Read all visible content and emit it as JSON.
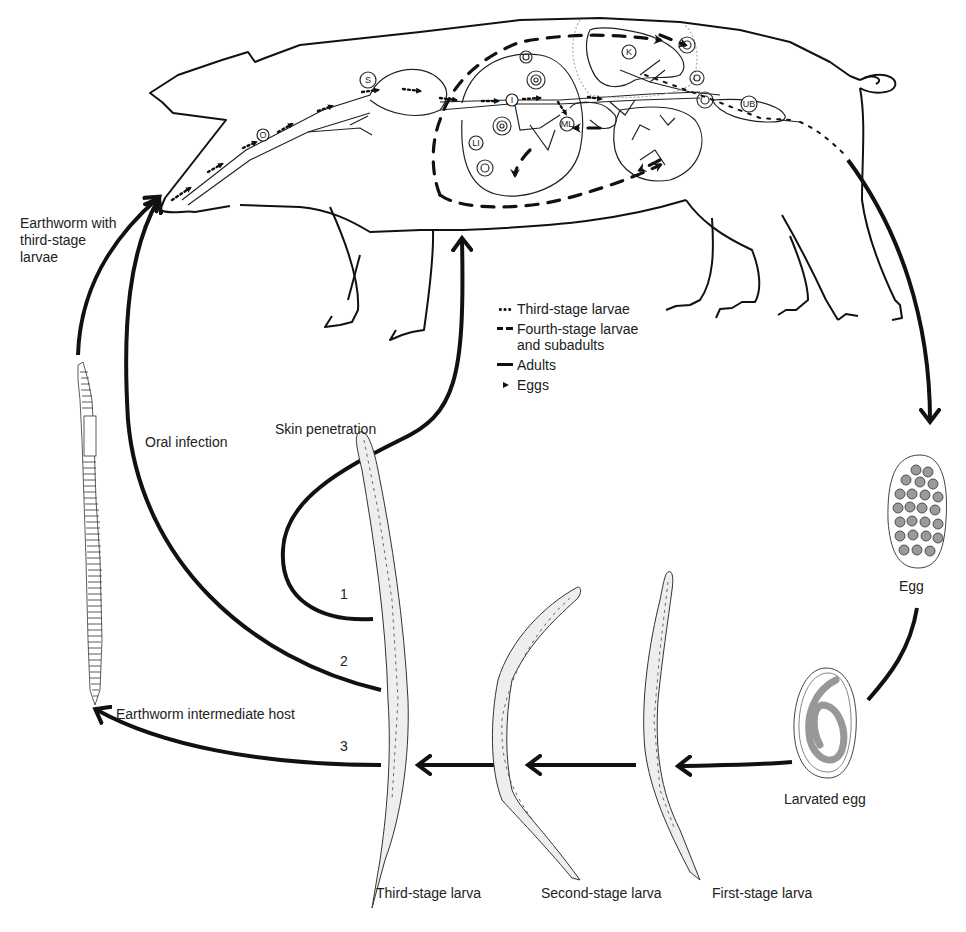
{
  "host": {
    "name": "Pig",
    "organ_labels": [
      "O",
      "S",
      "I",
      "LI",
      "ML",
      "K",
      "UB"
    ]
  },
  "legend": {
    "items": [
      {
        "symbol": "dotted-arrow",
        "label": "Third-stage larvae"
      },
      {
        "symbol": "dashed-arrow",
        "label": "Fourth-stage larvae",
        "label_line2": "and subadults"
      },
      {
        "symbol": "solid-line",
        "label": "Adults"
      },
      {
        "symbol": "small-arrowhead",
        "label": "Eggs"
      }
    ]
  },
  "stages": {
    "egg": "Egg",
    "larvated_egg": "Larvated egg",
    "first_stage": "First-stage larva",
    "second_stage": "Second-stage larva",
    "third_stage": "Third-stage larva"
  },
  "routes": {
    "earthworm_with_larvae": {
      "line1": "Earthworm with",
      "line2": "third-stage",
      "line3": "larvae"
    },
    "oral_infection": "Oral infection",
    "skin_penetration": "Skin penetration",
    "earthworm_host": "Earthworm intermediate host",
    "route_numbers": [
      "1",
      "2",
      "3"
    ]
  }
}
